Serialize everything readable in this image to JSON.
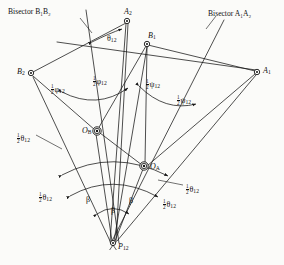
{
  "figure": {
    "type": "kinematic-pole-bisector-diagram",
    "background_color": "#fbfbf9",
    "line_color": "#141414",
    "text_color": "#111111"
  },
  "annotations": {
    "bisector_b": "Bisector B₁B₂",
    "bisector_a": "Bisector A₁A₂"
  },
  "points": [
    {
      "id": "A2",
      "label": "A",
      "sub": "2",
      "x": 127,
      "y": 21,
      "marker": "circle-dot"
    },
    {
      "id": "B1",
      "label": "B",
      "sub": "1",
      "x": 147,
      "y": 44,
      "marker": "circle-dot"
    },
    {
      "id": "B2",
      "label": "B",
      "sub": "2",
      "x": 31,
      "y": 73,
      "marker": "circle-dot"
    },
    {
      "id": "A1",
      "label": "A",
      "sub": "1",
      "x": 257,
      "y": 72,
      "marker": "circle-dot"
    },
    {
      "id": "OB",
      "label": "O",
      "sub": "B",
      "x": 97,
      "y": 131,
      "marker": "double-circle"
    },
    {
      "id": "OA",
      "label": "O",
      "sub": "A",
      "x": 144,
      "y": 166,
      "marker": "double-circle"
    },
    {
      "id": "P12",
      "label": "P",
      "sub": "12",
      "x": 113,
      "y": 243,
      "marker": "pivot"
    }
  ],
  "angle_labels": [
    {
      "id": "theta12-top",
      "kind": "theta",
      "half": false,
      "symbol": "θ",
      "sub": "12",
      "x": 107,
      "y": 35
    },
    {
      "id": "phi12-left",
      "kind": "phi",
      "half": true,
      "symbol": "φ",
      "sub": "12",
      "x": 51,
      "y": 84
    },
    {
      "id": "phi12-right",
      "kind": "phi",
      "half": true,
      "symbol": "φ",
      "sub": "12",
      "x": 93,
      "y": 76
    },
    {
      "id": "psi12-left",
      "kind": "psi",
      "half": true,
      "symbol": "ψ",
      "sub": "12",
      "x": 146,
      "y": 79
    },
    {
      "id": "psi12-right",
      "kind": "psi",
      "half": true,
      "symbol": "ψ",
      "sub": "12",
      "x": 177,
      "y": 95
    },
    {
      "id": "theta12-upleft",
      "kind": "theta",
      "half": true,
      "symbol": "θ",
      "sub": "12",
      "x": 17,
      "y": 133
    },
    {
      "id": "theta12-lowleft",
      "kind": "theta",
      "half": true,
      "symbol": "θ",
      "sub": "12",
      "x": 39,
      "y": 192
    },
    {
      "id": "theta12-upright",
      "kind": "theta",
      "half": true,
      "symbol": "θ",
      "sub": "12",
      "x": 186,
      "y": 184
    },
    {
      "id": "theta12-lowright",
      "kind": "theta",
      "half": true,
      "symbol": "θ",
      "sub": "12",
      "x": 163,
      "y": 199
    },
    {
      "id": "beta-left",
      "kind": "beta",
      "half": false,
      "symbol": "β",
      "sub": "",
      "x": 86,
      "y": 196
    },
    {
      "id": "beta-center",
      "kind": "beta",
      "half": false,
      "symbol": "β",
      "sub": "",
      "x": 111,
      "y": 207
    },
    {
      "id": "beta-right",
      "kind": "beta",
      "half": false,
      "symbol": "β",
      "sub": "",
      "x": 129,
      "y": 197
    }
  ],
  "segments": [
    {
      "name": "B2-A2",
      "x1": 33,
      "y1": 72,
      "x2": 126,
      "y2": 23
    },
    {
      "name": "B1-A1",
      "x1": 148,
      "y1": 45,
      "x2": 255,
      "y2": 71
    },
    {
      "name": "B2-B1-extend",
      "x1": 57,
      "y1": 42,
      "x2": 256,
      "y2": 70
    },
    {
      "name": "bisector-B-line",
      "x1": 86,
      "y1": 10,
      "x2": 119,
      "y2": 243
    },
    {
      "name": "bisector-A-line",
      "x1": 224,
      "y1": 20,
      "x2": 111,
      "y2": 243
    },
    {
      "name": "A2-P12-left",
      "x1": 126,
      "y1": 24,
      "x2": 110,
      "y2": 242
    },
    {
      "name": "A2-P12-right",
      "x1": 128,
      "y1": 24,
      "x2": 116,
      "y2": 242
    },
    {
      "name": "B1-OB",
      "x1": 146,
      "y1": 46,
      "x2": 98,
      "y2": 129
    },
    {
      "name": "B1-P12",
      "x1": 147,
      "y1": 47,
      "x2": 114,
      "y2": 241
    },
    {
      "name": "B1-OA",
      "x1": 147,
      "y1": 47,
      "x2": 145,
      "y2": 164
    },
    {
      "name": "B2-OB",
      "x1": 33,
      "y1": 76,
      "x2": 95,
      "y2": 130
    },
    {
      "name": "B2-P12",
      "x1": 33,
      "y1": 77,
      "x2": 110,
      "y2": 241
    },
    {
      "name": "OB-P12",
      "x1": 96,
      "y1": 134,
      "x2": 112,
      "y2": 241
    },
    {
      "name": "OA-P12",
      "x1": 143,
      "y1": 169,
      "x2": 115,
      "y2": 241
    },
    {
      "name": "A1-OA",
      "x1": 255,
      "y1": 74,
      "x2": 147,
      "y2": 166
    },
    {
      "name": "A1-P12",
      "x1": 256,
      "y1": 75,
      "x2": 117,
      "y2": 241
    },
    {
      "name": "OB-OA",
      "x1": 100,
      "y1": 133,
      "x2": 142,
      "y2": 165
    }
  ],
  "arcs": [
    {
      "name": "arc-phi",
      "d": "M 62 92 Q 97 110 128 88"
    },
    {
      "name": "arc-psi",
      "d": "M 139 86 Q 165 112 196 104"
    },
    {
      "name": "arc-theta-near",
      "d": "M 62 175 Q 113 148 168 176"
    },
    {
      "name": "arc-theta-far",
      "d": "M 70 196 Q 113 172 158 197"
    },
    {
      "name": "arc-beta",
      "d": "M 97 214 Q 113 203 129 214"
    },
    {
      "name": "arc-theta-top",
      "d": "M 92 42 Q 110 33 122 29"
    }
  ],
  "leaders": [
    {
      "name": "leader-theta-upleft",
      "x1": 36,
      "y1": 135,
      "x2": 62,
      "y2": 149
    },
    {
      "name": "leader-theta-upright",
      "x1": 183,
      "y1": 185,
      "x2": 158,
      "y2": 180
    },
    {
      "name": "leader-bisector-b",
      "x1": 80,
      "y1": 18,
      "x2": 92,
      "y2": 33
    },
    {
      "name": "leader-bisector-a",
      "x1": 206,
      "y1": 29,
      "x2": 216,
      "y2": 16
    }
  ]
}
